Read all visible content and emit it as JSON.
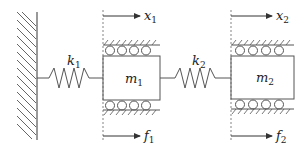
{
  "diagram": {
    "colors": {
      "stroke": "#555555",
      "text": "#222222",
      "background": "#ffffff"
    },
    "wall": {
      "label": "fixed-wall"
    },
    "springs": [
      {
        "id": "k1",
        "symbol": "k",
        "subscript": "1"
      },
      {
        "id": "k2",
        "symbol": "k",
        "subscript": "2"
      }
    ],
    "masses": [
      {
        "id": "m1",
        "symbol": "m",
        "subscript": "1"
      },
      {
        "id": "m2",
        "symbol": "m",
        "subscript": "2"
      }
    ],
    "displacements": [
      {
        "id": "x1",
        "symbol": "x",
        "subscript": "1"
      },
      {
        "id": "x2",
        "symbol": "x",
        "subscript": "2"
      }
    ],
    "forces": [
      {
        "id": "f1",
        "symbol": "f",
        "subscript": "1"
      },
      {
        "id": "f2",
        "symbol": "f",
        "subscript": "2"
      }
    ]
  }
}
